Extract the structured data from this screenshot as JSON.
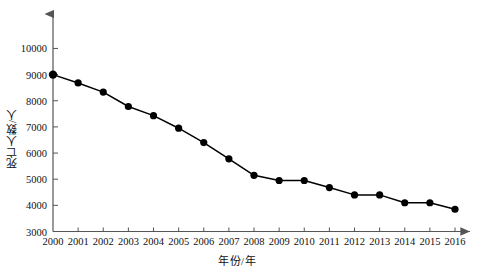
{
  "chart_data": {
    "type": "line",
    "title": "",
    "subtitle": "",
    "xlabel": "年份/年",
    "ylabel": "死亡人数/人",
    "x": [
      2000,
      2001,
      2002,
      2003,
      2004,
      2005,
      2006,
      2007,
      2008,
      2009,
      2010,
      2011,
      2012,
      2013,
      2014,
      2015,
      2016
    ],
    "categories": [
      "2000",
      "2001",
      "2002",
      "2003",
      "2004",
      "2005",
      "2006",
      "2007",
      "2008",
      "2009",
      "2010",
      "2011",
      "2012",
      "2013",
      "2014",
      "2015",
      "2016"
    ],
    "values": [
      9000,
      8680,
      8330,
      7780,
      7430,
      6950,
      6400,
      5780,
      5150,
      4950,
      4950,
      4680,
      4400,
      4400,
      4100,
      4100,
      3850
    ],
    "series": [
      {
        "name": "死亡人数",
        "values": [
          9000,
          8680,
          8330,
          7780,
          7430,
          6950,
          6400,
          5780,
          5150,
          4950,
          4950,
          4680,
          4400,
          4400,
          4100,
          4100,
          3850
        ]
      }
    ],
    "ylim": [
      3000,
      10000
    ],
    "yticks": [
      3000,
      4000,
      5000,
      6000,
      7000,
      8000,
      9000,
      10000
    ],
    "ytick_labels": [
      "3000",
      "4000",
      "5000",
      "6000",
      "7000",
      "8000",
      "9000",
      "10000"
    ],
    "xlim": [
      2000,
      2016
    ],
    "xticks": [
      2000,
      2001,
      2002,
      2003,
      2004,
      2005,
      2006,
      2007,
      2008,
      2009,
      2010,
      2011,
      2012,
      2013,
      2014,
      2015,
      2016
    ],
    "xtick_labels": [
      "2000",
      "2001",
      "2002",
      "2003",
      "2004",
      "2005",
      "2006",
      "2007",
      "2008",
      "2009",
      "2010",
      "2011",
      "2012",
      "2013",
      "2014",
      "2015",
      "2016"
    ],
    "grid": false,
    "legend": null,
    "legend_position": "none",
    "marker": "filled-circle",
    "line_color": "#000000",
    "marker_color": "#000000",
    "background_color": "#ffffff",
    "axis_color": "#555555",
    "axis_arrow": true
  }
}
